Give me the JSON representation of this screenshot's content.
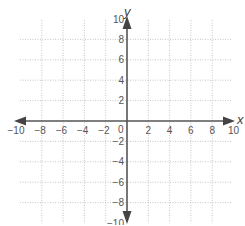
{
  "chart_data": {
    "type": "scatter",
    "title": "",
    "xlabel": "x",
    "ylabel": "y",
    "xlim": [
      -10,
      10
    ],
    "ylim": [
      -10,
      10
    ],
    "grid": true,
    "grid_style": "dotted",
    "grid_step": 2,
    "x_ticks": [
      -10,
      -8,
      -6,
      -4,
      -2,
      2,
      4,
      6,
      8,
      10
    ],
    "y_ticks": [
      10,
      8,
      6,
      4,
      2,
      -2,
      -4,
      -6,
      -8,
      -10
    ],
    "origin_label": "0",
    "series": [],
    "colors": {
      "axis": "#555555",
      "grid": "#b8b8b8",
      "text": "#555555"
    }
  }
}
